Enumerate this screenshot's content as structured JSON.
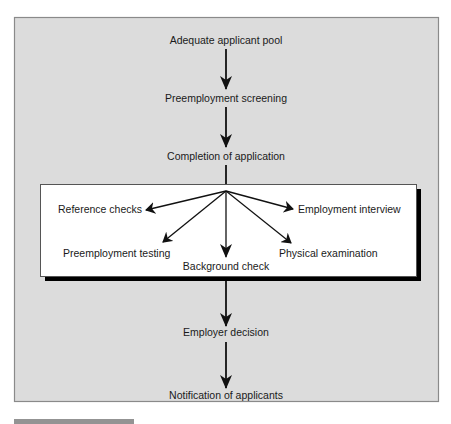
{
  "diagram": {
    "colors": {
      "panel_fill": "#dcdcdc",
      "panel_border": "#8a8a8a",
      "box_fill": "#ffffff",
      "box_shadow": "#000000",
      "arrow": "#111111",
      "text": "#1a1a1a"
    },
    "steps": [
      {
        "id": "adequate-applicant-pool",
        "label": "Adequate applicant pool"
      },
      {
        "id": "preemployment-screening",
        "label": "Preemployment screening"
      },
      {
        "id": "completion-of-application",
        "label": "Completion of application"
      },
      {
        "id": "employer-decision",
        "label": "Employer decision"
      },
      {
        "id": "notification-of-applicants",
        "label": "Notification of applicants"
      }
    ],
    "screening_activities": [
      {
        "id": "reference-checks",
        "label": "Reference checks"
      },
      {
        "id": "employment-interview",
        "label": "Employment interview"
      },
      {
        "id": "preemployment-testing",
        "label": "Preemployment testing"
      },
      {
        "id": "background-check",
        "label": "Background check"
      },
      {
        "id": "physical-examination",
        "label": "Physical examination"
      }
    ],
    "edges": [
      {
        "from": "adequate-applicant-pool",
        "to": "preemployment-screening"
      },
      {
        "from": "preemployment-screening",
        "to": "completion-of-application"
      },
      {
        "from": "completion-of-application",
        "to": "screening-activities-box"
      },
      {
        "from": "screening-activities-box",
        "to": "reference-checks"
      },
      {
        "from": "screening-activities-box",
        "to": "employment-interview"
      },
      {
        "from": "screening-activities-box",
        "to": "preemployment-testing"
      },
      {
        "from": "screening-activities-box",
        "to": "background-check"
      },
      {
        "from": "screening-activities-box",
        "to": "physical-examination"
      },
      {
        "from": "screening-activities-box",
        "to": "employer-decision"
      },
      {
        "from": "employer-decision",
        "to": "notification-of-applicants"
      }
    ]
  }
}
